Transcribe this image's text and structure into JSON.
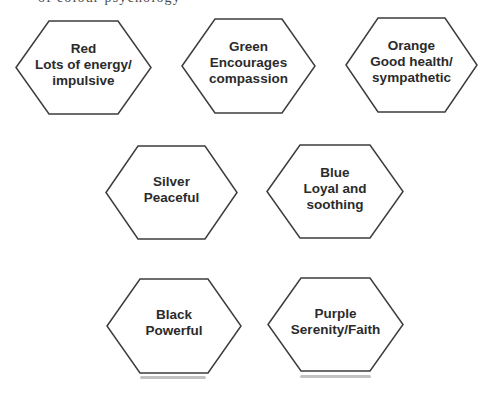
{
  "page": {
    "background_color": "#ffffff",
    "cropped_caption": "of colour psychology"
  },
  "diagram": {
    "stroke_color": "#3d3d3d",
    "text_color": "#2b2b2b",
    "hexagons": [
      {
        "id": "red",
        "title": "Red",
        "description": "Lots of energy/\nimpulsive"
      },
      {
        "id": "green",
        "title": "Green",
        "description": "Encourages\ncompassion"
      },
      {
        "id": "orange",
        "title": "Orange",
        "description": "Good health/\nsympathetic"
      },
      {
        "id": "silver",
        "title": "Silver",
        "description": "Peaceful"
      },
      {
        "id": "blue",
        "title": "Blue",
        "description": "Loyal and\nsoothing"
      },
      {
        "id": "black",
        "title": "Black",
        "description": "Powerful"
      },
      {
        "id": "purple",
        "title": "Purple",
        "description": "Serenity/Faith"
      }
    ]
  }
}
